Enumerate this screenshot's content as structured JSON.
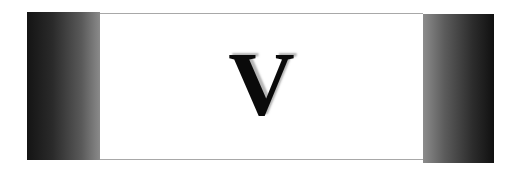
{
  "banner": {
    "letter": "V",
    "colors": {
      "left_panel_dark": "#141414",
      "left_panel_light": "#8a8a8a",
      "right_panel_light": "#8c8c8c",
      "right_panel_dark": "#101010",
      "center_background": "#ffffff",
      "border": "#a8a8a8",
      "letter": "#0a0a0a"
    }
  }
}
